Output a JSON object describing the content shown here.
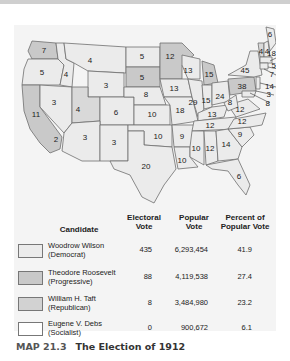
{
  "colors": {
    "wilson": "#ebebeb",
    "roosevelt": "#c9c9c9",
    "taft": "#d4d4d4",
    "debs": "#ffffff",
    "panel": "#f4f4f4",
    "border": "#6f6f6f"
  },
  "map": {
    "states": [
      {
        "name": "Washington",
        "votes": "7",
        "winner": "Roosevelt"
      },
      {
        "name": "Oregon",
        "votes": "5",
        "winner": "Wilson"
      },
      {
        "name": "California",
        "votes": "11",
        "winner": "Roosevelt (11 of 13)"
      },
      {
        "name": "Idaho",
        "votes": "4",
        "winner": "Wilson"
      },
      {
        "name": "Nevada",
        "votes": "3",
        "winner": "Wilson"
      },
      {
        "name": "Montana",
        "votes": "4",
        "winner": "Wilson"
      },
      {
        "name": "Wyoming",
        "votes": "3",
        "winner": "Wilson"
      },
      {
        "name": "Utah",
        "votes": "4",
        "winner": "Taft"
      },
      {
        "name": "Colorado",
        "votes": "6",
        "winner": "Wilson"
      },
      {
        "name": "Arizona",
        "votes": "3",
        "winner": "Wilson"
      },
      {
        "name": "New Mexico",
        "votes": "3",
        "winner": "Wilson"
      },
      {
        "name": "California (Wilson)",
        "votes": "2",
        "winner": "Wilson"
      },
      {
        "name": "North Dakota",
        "votes": "5",
        "winner": "Wilson"
      },
      {
        "name": "South Dakota",
        "votes": "5",
        "winner": "Roosevelt"
      },
      {
        "name": "Nebraska",
        "votes": "8",
        "winner": "Wilson"
      },
      {
        "name": "Kansas",
        "votes": "10",
        "winner": "Wilson"
      },
      {
        "name": "Oklahoma",
        "votes": "10",
        "winner": "Wilson"
      },
      {
        "name": "Texas",
        "votes": "20",
        "winner": "Wilson"
      },
      {
        "name": "Minnesota",
        "votes": "12",
        "winner": "Roosevelt"
      },
      {
        "name": "Iowa",
        "votes": "13",
        "winner": "Wilson"
      },
      {
        "name": "Missouri",
        "votes": "18",
        "winner": "Wilson"
      },
      {
        "name": "Arkansas",
        "votes": "9",
        "winner": "Wilson"
      },
      {
        "name": "Louisiana",
        "votes": "10",
        "winner": "Wilson"
      },
      {
        "name": "Wisconsin",
        "votes": "13",
        "winner": "Wilson"
      },
      {
        "name": "Illinois",
        "votes": "29",
        "winner": "Wilson"
      },
      {
        "name": "Michigan",
        "votes": "15",
        "winner": "Roosevelt"
      },
      {
        "name": "Indiana",
        "votes": "15",
        "winner": "Wilson"
      },
      {
        "name": "Ohio",
        "votes": "24",
        "winner": "Wilson"
      },
      {
        "name": "Kentucky",
        "votes": "13",
        "winner": "Wilson"
      },
      {
        "name": "Tennessee",
        "votes": "12",
        "winner": "Wilson"
      },
      {
        "name": "Mississippi",
        "votes": "10",
        "winner": "Wilson"
      },
      {
        "name": "Alabama",
        "votes": "12",
        "winner": "Wilson"
      },
      {
        "name": "Georgia",
        "votes": "14",
        "winner": "Wilson"
      },
      {
        "name": "Florida",
        "votes": "6",
        "winner": "Wilson"
      },
      {
        "name": "South Carolina",
        "votes": "9",
        "winner": "Wilson"
      },
      {
        "name": "North Carolina",
        "votes": "12",
        "winner": "Wilson"
      },
      {
        "name": "Virginia",
        "votes": "12",
        "winner": "Wilson"
      },
      {
        "name": "West Virginia",
        "votes": "8",
        "winner": "Wilson"
      },
      {
        "name": "Pennsylvania",
        "votes": "38",
        "winner": "Roosevelt"
      },
      {
        "name": "New York",
        "votes": "45",
        "winner": "Wilson"
      },
      {
        "name": "Vermont",
        "votes": "4",
        "winner": "Taft"
      },
      {
        "name": "New Hampshire",
        "votes": "4",
        "winner": "Wilson"
      },
      {
        "name": "Maine",
        "votes": "6",
        "winner": "Wilson"
      },
      {
        "name": "Massachusetts",
        "votes": "18",
        "winner": "Wilson"
      },
      {
        "name": "Rhode Island",
        "votes": "5",
        "winner": "Wilson"
      },
      {
        "name": "Connecticut",
        "votes": "7",
        "winner": "Wilson"
      },
      {
        "name": "New Jersey",
        "votes": "14",
        "winner": "Wilson"
      },
      {
        "name": "Delaware",
        "votes": "3",
        "winner": "Wilson"
      },
      {
        "name": "Maryland",
        "votes": "8",
        "winner": "Wilson"
      }
    ]
  },
  "legend": {
    "headers": {
      "candidate": "Candidate",
      "electoral_1": "Electoral",
      "electoral_2": "Vote",
      "popular_1": "Popular",
      "popular_2": "Vote",
      "percent_1": "Percent of",
      "percent_2": "Popular Vote"
    },
    "rows": [
      {
        "name": "Woodrow Wilson",
        "party": "(Democrat)",
        "electoral": "435",
        "popular": "6,293,454",
        "percent": "41.9"
      },
      {
        "name": "Theodore Roosevelt",
        "party": "(Progressive)",
        "electoral": "88",
        "popular": "4,119,538",
        "percent": "27.4"
      },
      {
        "name": "William H. Taft",
        "party": "(Republican)",
        "electoral": "8",
        "popular": "3,484,980",
        "percent": "23.2"
      },
      {
        "name": "Eugene V. Debs",
        "party": "(Socialist)",
        "electoral": "0",
        "popular": "900,672",
        "percent": "6.1"
      }
    ]
  },
  "caption": {
    "number": "MAP 21.3",
    "title": "The Election of 1912"
  }
}
